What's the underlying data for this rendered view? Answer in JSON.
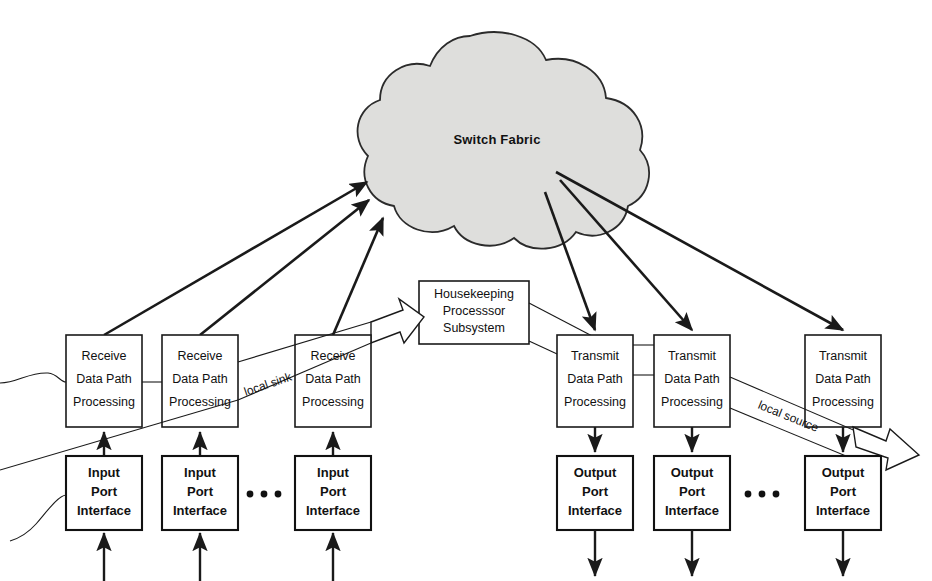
{
  "figure": {
    "caption_partial": "",
    "cloud": {
      "label": "Switch Fabric",
      "fill": "#dededc",
      "stroke": "#2b2b2b"
    },
    "receive_boxes": [
      {
        "line1": "Receive",
        "line2": "Data Path",
        "line3": "Processing"
      },
      {
        "line1": "Receive",
        "line2": "Data Path",
        "line3": "Processing"
      },
      {
        "line1": "Receive",
        "line2": "Data Path",
        "line3": "Processing"
      }
    ],
    "transmit_boxes": [
      {
        "line1": "Transmit",
        "line2": "Data Path",
        "line3": "Processing"
      },
      {
        "line1": "Transmit",
        "line2": "Data Path",
        "line3": "Processing"
      },
      {
        "line1": "Transmit",
        "line2": "Data Path",
        "line3": "Processing"
      }
    ],
    "input_port_boxes": [
      {
        "line1": "Input",
        "line2": "Port",
        "line3": "Interface"
      },
      {
        "line1": "Input",
        "line2": "Port",
        "line3": "Interface"
      },
      {
        "line1": "Input",
        "line2": "Port",
        "line3": "Interface"
      }
    ],
    "output_port_boxes": [
      {
        "line1": "Output",
        "line2": "Port",
        "line3": "Interface"
      },
      {
        "line1": "Output",
        "line2": "Port",
        "line3": "Interface"
      },
      {
        "line1": "Output",
        "line2": "Port",
        "line3": "Interface"
      }
    ],
    "housekeeping": {
      "line1": "Housekeeping",
      "line2": "Processsor",
      "line3": "Subsystem"
    },
    "edge_labels": {
      "local_sink": "local sink",
      "local_source": "local source"
    },
    "ellipsis": "• • •"
  }
}
